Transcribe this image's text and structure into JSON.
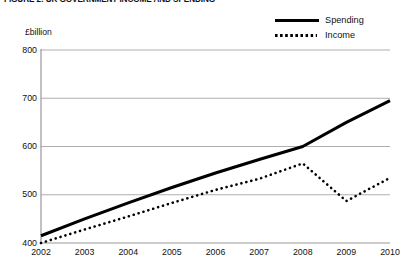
{
  "figure": {
    "title": "FIGURE 2: UK GOVERNMENT INCOME AND SPENDING"
  },
  "legend": {
    "position": "top-right",
    "items": [
      {
        "label": "Spending",
        "style": "solid",
        "color": "#000000",
        "icon": "solid-line-icon"
      },
      {
        "label": "Income",
        "style": "dotted",
        "color": "#000000",
        "icon": "dotted-line-icon"
      }
    ]
  },
  "axes": {
    "y_unit_label": "£billion",
    "y_ticks": [
      "800",
      "700",
      "600",
      "500",
      "400"
    ],
    "x_ticks": [
      "2002",
      "2003",
      "2004",
      "2005",
      "2006",
      "2007",
      "2008",
      "2009",
      "2010"
    ]
  },
  "chart_data": {
    "type": "line",
    "title": "FIGURE 2: UK GOVERNMENT INCOME AND SPENDING",
    "xlabel": "",
    "ylabel": "£billion",
    "x": [
      2002,
      2003,
      2004,
      2005,
      2006,
      2007,
      2008,
      2009,
      2010
    ],
    "xlim": [
      2002,
      2010
    ],
    "ylim": [
      400,
      800
    ],
    "y_ticks": [
      400,
      500,
      600,
      700,
      800
    ],
    "grid": "horizontal",
    "legend_position": "top-right",
    "series": [
      {
        "name": "Spending",
        "style": "solid",
        "color": "#000000",
        "values": [
          415,
          450,
          483,
          515,
          545,
          573,
          600,
          650,
          695
        ]
      },
      {
        "name": "Income",
        "style": "dotted",
        "color": "#000000",
        "values": [
          400,
          428,
          455,
          483,
          510,
          533,
          565,
          487,
          535
        ]
      }
    ]
  }
}
